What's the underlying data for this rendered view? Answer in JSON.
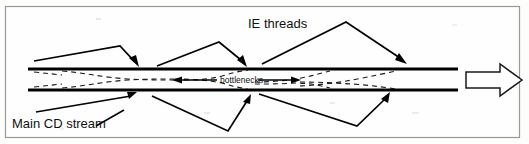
{
  "figure": {
    "title_alt": "Main CD stream with IE threads and bottlenecks",
    "background_color": "#fdfdfc",
    "frame_color": "#9a9a9a",
    "ink_color": "#000000"
  },
  "labels": {
    "ie_threads": "IE threads",
    "bottlenecks": "bottlenecks",
    "main_cd_stream": "Main CD stream"
  },
  "diagram_data": {
    "type": "schematic",
    "description": "Horizontal channel bounded by two thick black lines, containing three dashed lens-shaped constrictions (bottlenecks); three arrows descend from above and three arrows rise from below into the channel; a large hollow outline arrow at the right indicates the main flow direction.",
    "channel": {
      "top_line_y": 69,
      "bottom_line_y": 90,
      "x_start": 28,
      "x_end": 458
    },
    "bottleneck_count": 3,
    "bottleneck_centers_x": [
      118,
      236,
      352
    ],
    "ie_thread_arrow_count": 3,
    "ie_thread_arrow_tips": [
      [
        139,
        66
      ],
      [
        246,
        66
      ],
      [
        406,
        64
      ]
    ],
    "lower_arrow_count": 3,
    "lower_arrow_tips": [
      [
        136,
        92
      ],
      [
        251,
        95
      ],
      [
        389,
        92
      ]
    ],
    "inner_flow_arrows": [
      {
        "direction": "left",
        "x_from": 217,
        "x_to": 172,
        "y": 80
      },
      {
        "direction": "right",
        "x_from": 262,
        "x_to": 300,
        "y": 80
      }
    ],
    "big_flow_arrow": {
      "direction": "right",
      "x_start": 466,
      "x_end": 522,
      "y_center": 80,
      "fill": "#ffffff",
      "stroke": "#1a1a1a"
    }
  }
}
